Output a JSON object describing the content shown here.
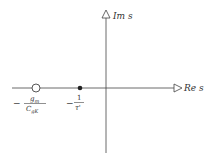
{
  "diagram": {
    "type": "s-plane pole-zero plot",
    "axes": {
      "imag_label": "Im s",
      "real_label": "Re s"
    },
    "zero": {
      "marker": "open-circle",
      "label_sign": "−",
      "label_num": "g",
      "label_num_sub": "m",
      "label_den": "C",
      "label_den_sub": "gK"
    },
    "pole": {
      "marker": "filled-dot",
      "label_sign": "−",
      "label_num": "1",
      "label_den": "τ'"
    },
    "colors": {
      "line": "#333333",
      "background": "#ffffff"
    }
  }
}
